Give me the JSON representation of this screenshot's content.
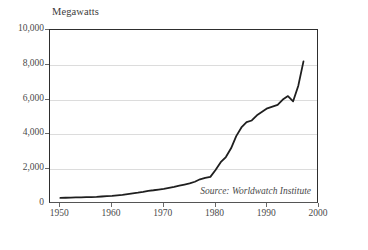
{
  "chart_data": {
    "type": "line",
    "title": "Megawatts",
    "xlabel": "",
    "ylabel": "Megawatts",
    "xlim": [
      1948,
      2000
    ],
    "ylim": [
      0,
      10000
    ],
    "grid": true,
    "legend": false,
    "source_note": "Source: Worldwatch Institute",
    "y_ticks": [
      "0",
      "2,000",
      "4,000",
      "6,000",
      "8,000",
      "10,000"
    ],
    "y_tick_values": [
      0,
      2000,
      4000,
      6000,
      8000,
      10000
    ],
    "x_ticks": [
      "1950",
      "1960",
      "1970",
      "1980",
      "1990",
      "2000"
    ],
    "x_tick_values": [
      1950,
      1960,
      1970,
      1980,
      1990,
      2000
    ],
    "series": [
      {
        "name": "Geothermal generating capacity",
        "color": "#1f1f1f",
        "x": [
          1950,
          1951,
          1952,
          1953,
          1954,
          1955,
          1956,
          1957,
          1958,
          1959,
          1960,
          1961,
          1962,
          1963,
          1964,
          1965,
          1966,
          1967,
          1968,
          1969,
          1970,
          1971,
          1972,
          1973,
          1974,
          1975,
          1976,
          1977,
          1978,
          1979,
          1980,
          1981,
          1982,
          1983,
          1984,
          1985,
          1986,
          1987,
          1988,
          1989,
          1990,
          1991,
          1992,
          1993,
          1994,
          1995,
          1996,
          1997
        ],
        "values": [
          350,
          360,
          370,
          375,
          380,
          390,
          400,
          410,
          430,
          450,
          470,
          500,
          530,
          570,
          610,
          650,
          700,
          760,
          790,
          830,
          870,
          930,
          990,
          1060,
          1120,
          1180,
          1280,
          1420,
          1500,
          1560,
          1950,
          2400,
          2700,
          3200,
          3900,
          4400,
          4700,
          4800,
          5100,
          5300,
          5500,
          5600,
          5700,
          6000,
          6200,
          5900,
          6800,
          8200
        ]
      }
    ]
  }
}
